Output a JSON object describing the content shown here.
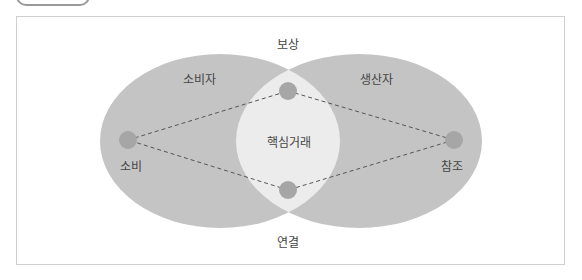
{
  "diagram": {
    "labels": {
      "top": "보상",
      "bottom": "연결",
      "left_region": "소비자",
      "right_region": "생산자",
      "center": "핵심거래",
      "left_node": "소비",
      "right_node": "참조"
    },
    "colors": {
      "ellipse": "#c4c4c4",
      "intersection": "#ececec",
      "node": "#a6a6a6",
      "dashed_line": "#555555",
      "frame": "#cfcfcf"
    }
  }
}
